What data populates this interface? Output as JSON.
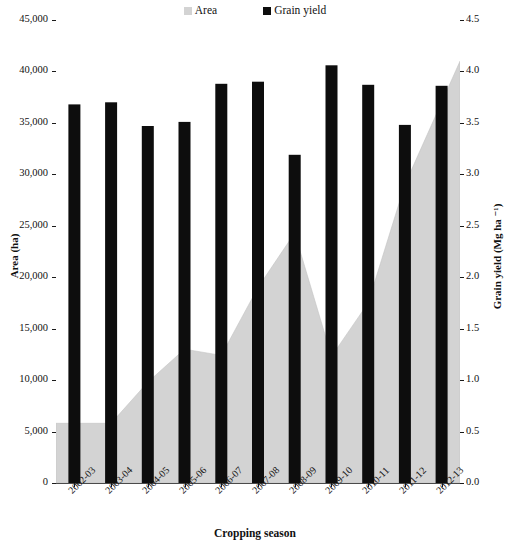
{
  "legend": {
    "items": [
      {
        "label": "Area",
        "color": "#d3d3d3",
        "marker": "area-swatch"
      },
      {
        "label": "Grain yield",
        "color": "#0d0d0d",
        "marker": "yield-swatch"
      }
    ]
  },
  "axes": {
    "left_title": "Area (ha)",
    "right_title": "Grain yield (Mg ha ⁻¹)",
    "x_title": "Cropping season",
    "left_ticks": [
      "0",
      "5,000",
      "10,000",
      "15,000",
      "20,000",
      "25,000",
      "30,000",
      "35,000",
      "40,000",
      "45,000"
    ],
    "right_ticks": [
      "0.0",
      "0.5",
      "1.0",
      "1.5",
      "2.0",
      "2.5",
      "3.0",
      "3.5",
      "4.0",
      "4.5"
    ]
  },
  "chart_data": {
    "type": "bar",
    "title": "",
    "xlabel": "Cropping season",
    "ylabel": "Area (ha)",
    "y2label": "Grain yield (Mg ha ⁻¹)",
    "ylim": [
      0,
      45000
    ],
    "y2lim": [
      0.0,
      4.5
    ],
    "grid": false,
    "legend_position": "top-center",
    "categories": [
      "2002-03",
      "2003-04",
      "2004-05",
      "2005-06",
      "2006-07",
      "2007-08",
      "2008-09",
      "2009-10",
      "2010-11",
      "2011-12",
      "2012-13"
    ],
    "series": [
      {
        "name": "Area",
        "type": "area",
        "axis": "left",
        "unit": "ha",
        "color": "#d3d3d3",
        "values": [
          5800,
          5800,
          9800,
          13000,
          12400,
          19000,
          24300,
          12300,
          17500,
          29000,
          41000
        ]
      },
      {
        "name": "Grain yield",
        "type": "bar",
        "axis": "right",
        "unit": "Mg ha-1",
        "color": "#0d0d0d",
        "values": [
          3.68,
          3.7,
          3.47,
          3.51,
          3.88,
          3.9,
          3.19,
          4.06,
          3.87,
          3.48,
          3.86
        ]
      }
    ]
  }
}
